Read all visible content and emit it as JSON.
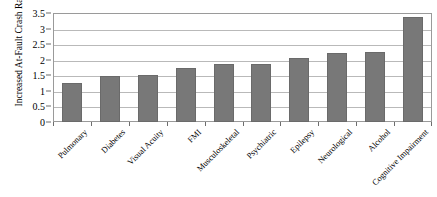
{
  "chart_data": {
    "type": "bar",
    "title": "",
    "subtitle": "",
    "xlabel": "",
    "ylabel": "Increased At-Fault Crash Rate",
    "ylim": [
      0,
      3.5
    ],
    "ytick_labels": [
      "0",
      "0.5",
      "1",
      "1.5",
      "2",
      "2.5",
      "3",
      "3.5"
    ],
    "ytick_values": [
      0,
      0.5,
      1,
      1.5,
      2,
      2.5,
      3,
      3.5
    ],
    "grid": true,
    "legend": false,
    "legend_position": "none",
    "orientation": "vertical",
    "bar_color": "#787878",
    "bar_edge_color": "#6a6a6a",
    "gridline_color": "#b9b9b9",
    "plot_border_color": "#9a9a9a",
    "background_color": "#ffffff",
    "x_label_rotation": -45,
    "categories": [
      "Pulmonary",
      "Diabetes",
      "Visual Acuity",
      "FMI",
      "Musculoskeletal",
      "Psychiatric",
      "Epilepsy",
      "Neurological",
      "Alcohol",
      "Cognitive Impairment"
    ],
    "values": [
      1.25,
      1.47,
      1.52,
      1.72,
      1.85,
      1.87,
      2.04,
      2.21,
      2.24,
      3.37
    ],
    "series": [
      {
        "name": "Increased At-Fault Crash Rate",
        "values": [
          1.25,
          1.47,
          1.52,
          1.72,
          1.85,
          1.87,
          2.04,
          2.21,
          2.24,
          3.37
        ]
      }
    ]
  }
}
